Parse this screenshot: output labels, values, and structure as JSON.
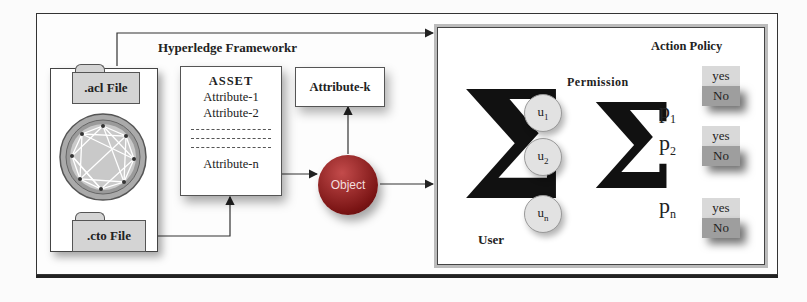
{
  "left_panel": {
    "acl_file": ".acl File",
    "cto_file": ".cto File",
    "logo_icon": "hyperledger-network-icon"
  },
  "framework": {
    "title": "Hyperledge Frameworkr",
    "asset_box": {
      "title": "ASSET",
      "attributes": [
        "Attribute-1",
        "Attribute-2",
        "Attribute-n"
      ]
    },
    "attribute_k": "Attribute-k",
    "object": "Object"
  },
  "right_panel": {
    "user_label": "User",
    "users": [
      "u",
      "u",
      "u"
    ],
    "user_subscripts": [
      "1",
      "2",
      "n"
    ],
    "permission_label": "Permission",
    "action_policy_label": "Action Policy",
    "permissions": [
      {
        "p": "p",
        "sub": "1",
        "yes": "yes",
        "no": "No"
      },
      {
        "p": "p",
        "sub": "2",
        "yes": "yes",
        "no": "No"
      },
      {
        "p": "p",
        "sub": "n",
        "yes": "yes",
        "no": "No"
      }
    ],
    "sigma": "Σ"
  }
}
